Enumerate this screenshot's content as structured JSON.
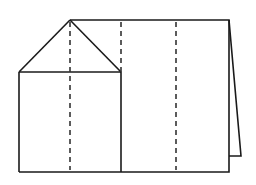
{
  "diagram": {
    "colors": {
      "line": "#1a1a1a",
      "dash": "#333333",
      "background": "#ffffff"
    },
    "shapes": {
      "flap_triangle": {
        "apex": [
          70,
          20
        ],
        "left": [
          19,
          72
        ],
        "right": [
          121,
          72
        ]
      },
      "left_panel": {
        "x": 19,
        "y": 72,
        "width": 102,
        "height": 100
      },
      "main_panel_outline": {
        "points": [
          [
            70,
            20
          ],
          [
            229,
            20
          ],
          [
            229,
            172
          ],
          [
            121,
            172
          ]
        ]
      },
      "back_panel": {
        "points": [
          [
            229,
            20
          ],
          [
            241,
            156
          ],
          [
            229,
            156
          ]
        ]
      }
    },
    "fold_lines": [
      {
        "x": 70,
        "y1": 20,
        "y2": 172,
        "style": "dashed"
      },
      {
        "x": 121,
        "y1": 20,
        "y2": 72,
        "style": "dashed"
      },
      {
        "x": 176,
        "y1": 20,
        "y2": 172,
        "style": "dashed"
      }
    ]
  }
}
